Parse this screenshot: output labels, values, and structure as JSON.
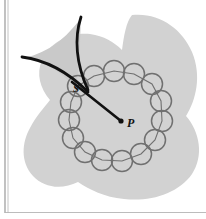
{
  "figure": {
    "background_color": "#ffffff",
    "region_fill": "#d2d2d2",
    "wedge_fill": "#c9c9c9",
    "curve_color": "#111111",
    "circle_stroke": "#707070",
    "rule_color": "#9a9a9a",
    "labels": [
      {
        "id": "s",
        "text": "S",
        "x": 76,
        "y": 92
      },
      {
        "id": "p",
        "text": "P",
        "x": 127,
        "y": 127
      }
    ],
    "points": [
      {
        "id": "p-dot",
        "label": "P",
        "x": 121,
        "y": 121
      }
    ],
    "rules": {
      "left_vertical": {
        "x": 5,
        "y1": 0,
        "y2": 213
      },
      "bottom_horizontal": {
        "x1": 5,
        "x2": 206,
        "y": 212
      }
    },
    "blob_path": "M 132,15 C 158,12 182,28 192,52 C 202,76 196,100 186,116 C 200,132 204,156 192,174 C 178,194 150,202 124,199 C 104,197 90,190 78,182 C 62,190 44,188 33,176 C 20,162 22,142 30,128 C 36,116 44,108 50,100 C 40,88 36,74 42,60 C 50,42 70,32 90,34 C 104,36 114,42 122,50 C 124,36 126,22 132,15 Z",
    "wedge_path": "M 81,18 C 66,38 50,52 24,58 C 42,60 60,70 76,88 C 80,62 80,38 81,18 Z",
    "curve_upper_path": "M 81,17 C 74,38 76,64 88,90",
    "curve_lower_path": "M 22,57 C 46,60 68,72 88,92",
    "chord_path": "M 72,82 L 121,121",
    "circle_radius": 10.5,
    "circle_chain": [
      {
        "cx": 78,
        "cy": 86
      },
      {
        "cx": 94,
        "cy": 76
      },
      {
        "cx": 114,
        "cy": 71
      },
      {
        "cx": 134,
        "cy": 74
      },
      {
        "cx": 152,
        "cy": 84
      },
      {
        "cx": 161,
        "cy": 101
      },
      {
        "cx": 162,
        "cy": 121
      },
      {
        "cx": 155,
        "cy": 140
      },
      {
        "cx": 141,
        "cy": 154
      },
      {
        "cx": 122,
        "cy": 161
      },
      {
        "cx": 102,
        "cy": 160
      },
      {
        "cx": 85,
        "cy": 152
      },
      {
        "cx": 73,
        "cy": 138
      },
      {
        "cx": 69,
        "cy": 120
      },
      {
        "cx": 71,
        "cy": 102
      }
    ],
    "chain_link_path": "M 78,86 L 94,76 L 114,71 L 134,74 L 152,84 L 161,101 L 162,121 L 155,140 L 141,154 L 122,161 L 102,160 L 85,152 L 73,138 L 69,120 L 71,102 Z"
  }
}
